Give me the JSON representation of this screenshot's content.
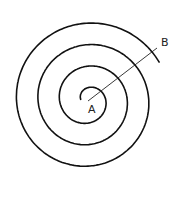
{
  "diagram": {
    "type": "archimedean-spiral",
    "labels": {
      "center": "A",
      "outer": "B"
    },
    "colors": {
      "stroke": "#111111",
      "background": "#ffffff"
    }
  }
}
